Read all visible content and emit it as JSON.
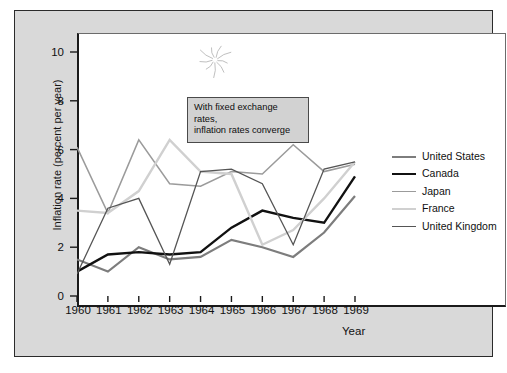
{
  "chart_data": {
    "type": "line",
    "title": "",
    "xlabel": "Year",
    "ylabel": "Inflation rate (percent per year)",
    "xlim": [
      1960,
      1969
    ],
    "ylim": [
      0,
      11.2
    ],
    "yticks": [
      0,
      2,
      4,
      6,
      8,
      10
    ],
    "grid": false,
    "legend_position": "right",
    "x": [
      1960,
      1961,
      1962,
      1963,
      1964,
      1965,
      1966,
      1967,
      1968,
      1969
    ],
    "categories": [
      "1960",
      "1961",
      "1962",
      "1963",
      "1964",
      "1965",
      "1966",
      "1967",
      "1968",
      "1969"
    ],
    "series": [
      {
        "name": "United States",
        "color": "#7d7d7d",
        "width": 2.2,
        "values": [
          1.5,
          1.0,
          2.0,
          1.5,
          1.6,
          2.3,
          2.0,
          1.6,
          2.6,
          4.1
        ]
      },
      {
        "name": "Canada",
        "color": "#111111",
        "width": 2.4,
        "values": [
          1.0,
          1.7,
          1.8,
          1.7,
          1.8,
          2.8,
          3.5,
          3.2,
          3.0,
          4.9
        ]
      },
      {
        "name": "Japan",
        "color": "#9b9b9b",
        "width": 1.5,
        "values": [
          6.1,
          3.4,
          6.4,
          4.6,
          4.5,
          5.1,
          5.0,
          6.2,
          5.1,
          5.4
        ]
      },
      {
        "name": "France",
        "color": "#d0d0d0",
        "width": 2.4,
        "values": [
          3.5,
          3.4,
          4.3,
          6.4,
          5.1,
          5.0,
          2.1,
          2.7,
          4.0,
          5.5
        ]
      },
      {
        "name": "United Kingdom",
        "color": "#555555",
        "width": 1.3,
        "values": [
          0.9,
          3.6,
          4.0,
          1.3,
          5.1,
          5.2,
          4.6,
          2.1,
          5.2,
          5.5
        ]
      }
    ],
    "annotations": [
      {
        "name": "convergence-note",
        "line1": "With fixed exchange rates,",
        "line2": "inflation rates converge"
      }
    ],
    "decorations": [
      {
        "name": "starburst-marker"
      }
    ]
  },
  "legend": {
    "items": [
      {
        "label": "United States"
      },
      {
        "label": "Canada"
      },
      {
        "label": "Japan"
      },
      {
        "label": "France"
      },
      {
        "label": "United Kingdom"
      }
    ]
  },
  "axes": {
    "y_title": "Inflation rate (percent per year)",
    "x_title": "Year",
    "y_tick_labels": [
      "10",
      "8",
      "6",
      "4",
      "2",
      "0"
    ],
    "x_tick_labels": [
      "1960",
      "1961",
      "1962",
      "1963",
      "1964",
      "1965",
      "1966",
      "1967",
      "1968",
      "1969"
    ]
  },
  "colors": {
    "panel_bg": "#d9d9d9",
    "plot_bg": "#ffffff",
    "axis": "#1a1a1a",
    "annotation_bg": "#d2d2d2"
  }
}
